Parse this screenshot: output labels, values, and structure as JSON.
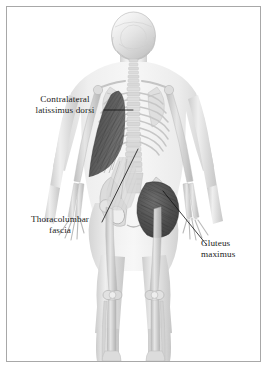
{
  "figure": {
    "view": "posterior",
    "background_color": "#ffffff",
    "border_color": "#a8a8a8",
    "label_text_color": "#1c1c1c",
    "leader_line_color": "#111111",
    "muscle_highlight_color": "#4a4a4a",
    "bone_color": "#c9c9c9",
    "body_silhouette_color": "#e3e3e3"
  },
  "labels": [
    {
      "id": "contralateral-latissimus-dorsi",
      "text": "Contralateral\nlatissimus dorsi",
      "line1": "Contralateral",
      "line2": "latissimus dorsi",
      "align": "center"
    },
    {
      "id": "thoracolumbar-fascia",
      "text": "Thoracolumbar\nfascia",
      "line1": "Thoracolumbar",
      "line2": "fascia",
      "align": "center"
    },
    {
      "id": "gluteus-maximus",
      "text": "Gluteus\nmaximus",
      "line1": "Gluteus",
      "line2": "maximus",
      "align": "left"
    }
  ],
  "structures": {
    "latissimus_dorsi": "Contralateral latissimus dorsi",
    "thoracolumbar_fascia": "Thoracolumbar fascia",
    "gluteus_maximus": "Gluteus maximus",
    "skeleton": "Translucent skeleton",
    "skull": "Skull",
    "spine": "Vertebral column",
    "ribcage": "Rib cage",
    "scapula": "Scapula",
    "pelvis": "Pelvis",
    "femur": "Femur",
    "tibia": "Tibia",
    "fibula": "Fibula",
    "humerus": "Humerus",
    "radius": "Radius",
    "ulna": "Ulna",
    "hand": "Hand bones",
    "foot": "Foot bones"
  }
}
